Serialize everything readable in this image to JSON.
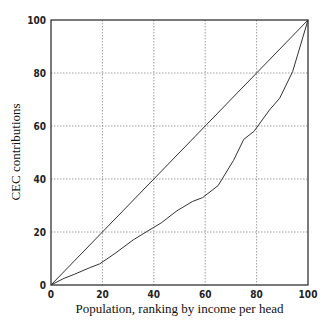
{
  "chart_data": {
    "type": "line",
    "title": "",
    "xlabel": "Population, ranking by income per head",
    "ylabel": "CEC contributions",
    "xlim": [
      0,
      100
    ],
    "ylim": [
      0,
      100
    ],
    "grid": true,
    "legend": null,
    "xticks": [
      0,
      20,
      40,
      60,
      80,
      100
    ],
    "yticks": [
      0,
      20,
      40,
      60,
      80,
      100
    ],
    "series": [
      {
        "name": "Line of equality",
        "x": [
          0,
          100
        ],
        "y": [
          0,
          100
        ]
      },
      {
        "name": "CEC contributions curve",
        "x": [
          0,
          5,
          9,
          15,
          19,
          25,
          32,
          37,
          43,
          49,
          55,
          59,
          65,
          71,
          75,
          79,
          85,
          89,
          94,
          100
        ],
        "y": [
          0,
          2.5,
          4,
          6.5,
          8,
          12,
          17,
          20,
          23.5,
          28,
          31.5,
          33,
          37.5,
          47,
          55,
          58,
          66,
          70.5,
          80.5,
          100
        ]
      }
    ]
  }
}
